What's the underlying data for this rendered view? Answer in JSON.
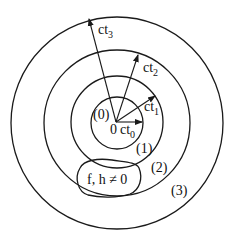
{
  "diagram": {
    "origin_label": "0",
    "circles": [
      {
        "id": "0",
        "region_label": "(0)",
        "radius_label": "ct",
        "radius_sub": "0"
      },
      {
        "id": "1",
        "region_label": "(1)",
        "radius_label": "ct",
        "radius_sub": "1"
      },
      {
        "id": "2",
        "region_label": "(2)",
        "radius_label": "ct",
        "radius_sub": "2"
      },
      {
        "id": "3",
        "region_label": "(3)",
        "radius_label": "ct",
        "radius_sub": "3"
      }
    ],
    "source_region_label": "f, h ≠ 0",
    "line_color": "#1a1a1a"
  }
}
